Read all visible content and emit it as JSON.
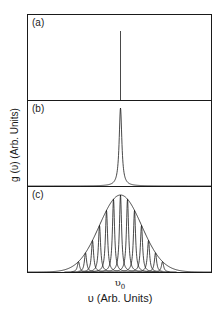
{
  "figure": {
    "panels": [
      {
        "label": "(a)",
        "description": "delta-function line shape at v0"
      },
      {
        "label": "(b)",
        "description": "homogeneously broadened (Lorentzian) line at v0"
      },
      {
        "label": "(c)",
        "description": "inhomogeneous Gaussian envelope of many narrow homogeneous lines"
      }
    ],
    "y_axis_label": "g (υ) (Arb. Units)",
    "x_tick_label_main": "υ",
    "x_tick_label_sub": "0",
    "x_axis_label": "υ (Arb. Units)",
    "line_color": "#1a1a1a",
    "frame_color": "#1a1a1a"
  },
  "chart_data": {
    "type": "line",
    "title": "",
    "xlabel": "υ (Arb. Units)",
    "ylabel": "g (υ) (Arb. Units)",
    "x_ticks": [
      "υ0"
    ],
    "grid": false,
    "legend": "none",
    "panels": [
      {
        "label": "(a)",
        "shape": "delta",
        "center": 0
      },
      {
        "label": "(b)",
        "shape": "lorentzian",
        "center": 0,
        "relative_width": 0.03
      },
      {
        "label": "(c)",
        "shape": "gaussian_envelope_of_lorentzians",
        "center": 0,
        "envelope_relative_width": 0.22,
        "num_component_lines": 13,
        "component_centers_relative": [
          -6,
          -5,
          -4,
          -3,
          -2,
          -1,
          0,
          1,
          2,
          3,
          4,
          5,
          6
        ]
      }
    ]
  }
}
